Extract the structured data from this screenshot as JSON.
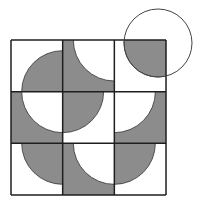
{
  "diagram": {
    "type": "grid-puzzle",
    "rows": 3,
    "cols": 3,
    "colors": {
      "fill": "#8c8c8c",
      "background": "#ffffff",
      "stroke": "#1e1e1e"
    },
    "grid": {
      "x": 11,
      "y": 40,
      "cell": 51.67
    },
    "arc_radius": 41,
    "cells": [
      {
        "row": 0,
        "col": 0,
        "base": "white",
        "arc_fill": "gray",
        "corner": "bottom-right"
      },
      {
        "row": 0,
        "col": 1,
        "base": "gray",
        "arc_fill": "white",
        "corner": "top-right"
      },
      {
        "row": 0,
        "col": 2,
        "base": "white",
        "arc_fill": "gray",
        "corner": "top-right",
        "note": "full circle outline extends outside grid"
      },
      {
        "row": 1,
        "col": 0,
        "base": "gray",
        "arc_fill": "white",
        "corner": "top-right"
      },
      {
        "row": 1,
        "col": 1,
        "base": "white",
        "arc_fill": "gray",
        "corner": "top-left"
      },
      {
        "row": 1,
        "col": 2,
        "base": "gray",
        "arc_fill": "white",
        "corner": "top-left"
      },
      {
        "row": 2,
        "col": 0,
        "base": "white",
        "arc_fill": "gray",
        "corner": "top-right"
      },
      {
        "row": 2,
        "col": 1,
        "base": "gray",
        "arc_fill": "white",
        "corner": "top-right"
      },
      {
        "row": 2,
        "col": 2,
        "base": "white",
        "arc_fill": "gray",
        "corner": "top-left"
      }
    ],
    "outer_circle": {
      "cx": 158,
      "cy": 43,
      "r": 34
    }
  }
}
